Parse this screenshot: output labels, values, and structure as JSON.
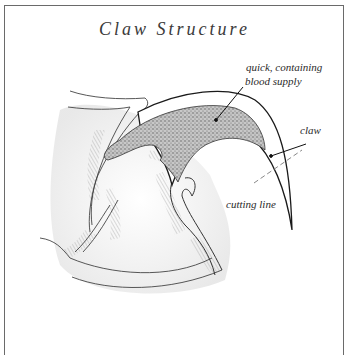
{
  "title": "Claw Structure",
  "labels": {
    "quick": [
      "quick, containing",
      "blood supply"
    ],
    "claw": "claw",
    "cutting_line": "cutting line"
  },
  "colors": {
    "line": "#1a1a1a",
    "stipple": "#8a8a8a",
    "hatch": "#9a9a9a",
    "frame": "#6a6a6a"
  }
}
